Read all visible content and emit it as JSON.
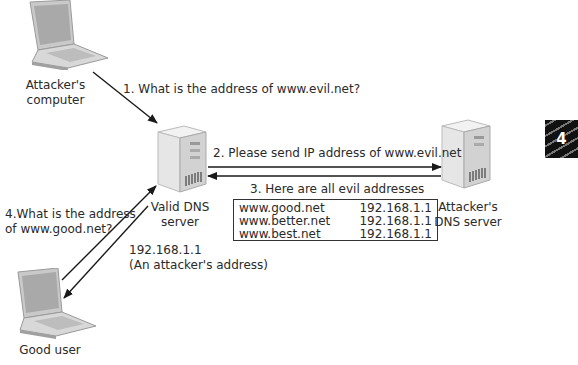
{
  "nodes": {
    "attacker_computer": {
      "label_line1": "Attacker's",
      "label_line2": "computer"
    },
    "valid_dns": {
      "label_line1": "Valid DNS",
      "label_line2": "server"
    },
    "attacker_dns": {
      "label_line1": "Attacker's",
      "label_line2": "DNS server"
    },
    "good_user": {
      "label": "Good user"
    }
  },
  "steps": {
    "step1": "1. What is the address of www.evil.net?",
    "step2": "2. Please send IP address of www.evil.net",
    "step3": "3. Here are all evil addresses",
    "step4_line1": "4.What is the address",
    "step4_line2": "of www.good.net?",
    "reply_line1": "192.168.1.1",
    "reply_line2": "(An attacker's address)"
  },
  "evil_addresses": [
    {
      "host": "www.good.net",
      "ip": "192.168.1.1"
    },
    {
      "host": "www.better.net",
      "ip": "192.168.1.1"
    },
    {
      "host": "www.best.net",
      "ip": "192.168.1.1"
    }
  ],
  "chapter_badge": "4"
}
